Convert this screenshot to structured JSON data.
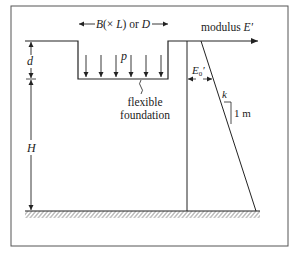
{
  "figure": {
    "type": "diagram",
    "labels": {
      "width": "B(× L) or D",
      "width_B": "B",
      "width_paren_open": "(× ",
      "width_L": "L",
      "width_or": ") or ",
      "width_D": "D",
      "pressure": "p",
      "depth": "d",
      "layer_thickness": "H",
      "foundation_line1": "flexible",
      "foundation_line2": "foundation",
      "modulus_text": "modulus ",
      "modulus_symbol": "E′",
      "surface_modulus_E": "E",
      "surface_modulus_sub": "0",
      "surface_modulus_prime": "′",
      "gradient": "k",
      "unit_depth": "1 m"
    },
    "load_arrow_count": 7,
    "colors": {
      "line": "#222222",
      "frame": "#555555",
      "background": "#ffffff"
    }
  }
}
